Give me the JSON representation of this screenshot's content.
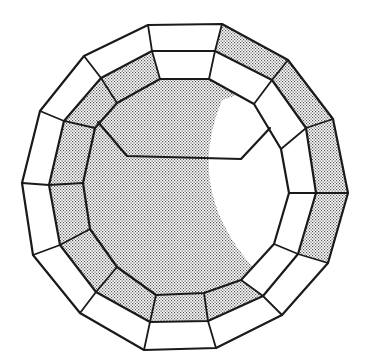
{
  "diagram": {
    "type": "concentric-polygon-rings",
    "sides": 14,
    "colors": {
      "line": "#1a1a1a",
      "stipple_dot": "#555555",
      "background": "#ffffff"
    },
    "rings": {
      "outer": [
        [
          148,
          25
        ],
        [
          222,
          24
        ],
        [
          288,
          60
        ],
        [
          333,
          119
        ],
        [
          348,
          193
        ],
        [
          328,
          263
        ],
        [
          282,
          315
        ],
        [
          216,
          348
        ],
        [
          144,
          350
        ],
        [
          80,
          313
        ],
        [
          33,
          255
        ],
        [
          22,
          183
        ],
        [
          40,
          111
        ],
        [
          84,
          56
        ]
      ],
      "middle": [
        [
          152,
          51
        ],
        [
          215,
          51
        ],
        [
          272,
          80
        ],
        [
          306,
          128
        ],
        [
          316,
          193
        ],
        [
          298,
          254
        ],
        [
          263,
          296
        ],
        [
          208,
          321
        ],
        [
          150,
          322
        ],
        [
          96,
          292
        ],
        [
          60,
          245
        ],
        [
          49,
          185
        ],
        [
          64,
          121
        ],
        [
          101,
          78
        ]
      ],
      "inner": [
        [
          160,
          79
        ],
        [
          209,
          79
        ],
        [
          254,
          104
        ],
        [
          281,
          149
        ],
        [
          289,
          193
        ],
        [
          274,
          244
        ],
        [
          241,
          280
        ],
        [
          204,
          293
        ],
        [
          156,
          295
        ],
        [
          117,
          267
        ],
        [
          90,
          229
        ],
        [
          83,
          183
        ],
        [
          95,
          128
        ],
        [
          117,
          103
        ]
      ]
    },
    "outer_band_shaded": [
      false,
      true,
      true,
      true,
      true,
      false,
      false,
      false,
      false,
      false,
      false,
      false,
      false,
      false
    ],
    "middle_band_shaded": [
      false,
      false,
      false,
      false,
      false,
      false,
      true,
      true,
      true,
      true,
      true,
      true,
      true,
      true
    ],
    "interior_polyline": [
      [
        98,
        122
      ],
      [
        127,
        156
      ],
      [
        241,
        159
      ],
      [
        270,
        128
      ]
    ],
    "white_crescent": {
      "arc_start": [
        222,
        100
      ],
      "arc_control": [
        180,
        200
      ],
      "arc_end": [
        270,
        285
      ]
    }
  }
}
